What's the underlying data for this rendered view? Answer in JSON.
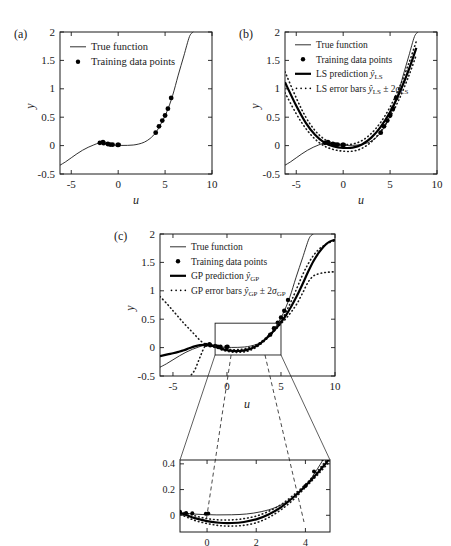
{
  "figure": {
    "panels": [
      {
        "tag": "(a)",
        "xlabel": "u",
        "ylabel": "y",
        "xticks": [
          "-5",
          "0",
          "5",
          "10"
        ],
        "yticks": [
          "-0.5",
          "0",
          "0.5",
          "1",
          "1.5",
          "2"
        ],
        "legend": [
          {
            "marker": "line-thin",
            "label": "True function"
          },
          {
            "marker": "dot",
            "label": "Training data points"
          }
        ]
      },
      {
        "tag": "(b)",
        "xlabel": "u",
        "ylabel": "y",
        "xticks": [
          "-5",
          "0",
          "5",
          "10"
        ],
        "yticks": [
          "-0.5",
          "0",
          "0.5",
          "1",
          "1.5",
          "2"
        ],
        "legend": [
          {
            "marker": "line-thin",
            "label": "True function"
          },
          {
            "marker": "dot",
            "label": "Training data points"
          },
          {
            "marker": "line-thick",
            "label": "LS prediction",
            "math_base": "y",
            "math_hat": true,
            "math_sub": "LS"
          },
          {
            "marker": "dotted",
            "label": "LS error bars",
            "math_base": "y",
            "math_hat": true,
            "math_sub": "LS",
            "math_tail": "± 2",
            "math_tail_sym": "σ",
            "math_tail_sub": "LS"
          }
        ]
      },
      {
        "tag": "(c)",
        "xlabel": "u",
        "ylabel": "y",
        "xticks": [
          "-5",
          "0",
          "5",
          "10"
        ],
        "yticks": [
          "-0.5",
          "0",
          "0.5",
          "1",
          "1.5",
          "2"
        ],
        "legend": [
          {
            "marker": "line-thin",
            "label": "True function"
          },
          {
            "marker": "dot",
            "label": "Training data points"
          },
          {
            "marker": "line-thick",
            "label": "GP prediction",
            "math_base": "y",
            "math_hat": true,
            "math_sub": "GP"
          },
          {
            "marker": "dotted",
            "label": "GP error bars",
            "math_base": "y",
            "math_hat": true,
            "math_sub": "GP",
            "math_tail": "± 2",
            "math_tail_sym": "σ",
            "math_tail_sub": "GP"
          }
        ]
      }
    ],
    "inset": {
      "xticks": [
        "0",
        "2",
        "4"
      ],
      "yticks": [
        "0",
        "0.2",
        "0.4"
      ],
      "xlim": [
        -1.1,
        5.0
      ],
      "ylim": [
        -0.13,
        0.43
      ]
    },
    "zoom_box": {
      "x0": -1.1,
      "x1": 5.0,
      "y0": -0.13,
      "y1": 0.43
    }
  },
  "chart_data": {
    "type": "line",
    "title": "",
    "xlabel": "u",
    "ylabel": "y",
    "xlim": [
      -6.2,
      10
    ],
    "ylim": [
      -0.5,
      2
    ],
    "xticks": [
      -5,
      0,
      5,
      10
    ],
    "yticks": [
      -0.5,
      0,
      0.5,
      1,
      1.5,
      2
    ],
    "grid": false,
    "legend_position": "top-left",
    "training_points": {
      "x": [
        -1.95,
        -1.62,
        -1.55,
        -1.1,
        -0.85,
        -0.6,
        -0.05,
        0.05,
        4.0,
        4.35,
        4.7,
        5.0,
        5.3,
        5.65
      ],
      "y": [
        0.048,
        0.062,
        0.042,
        0.028,
        0.018,
        0.016,
        0.012,
        0.014,
        0.228,
        0.34,
        0.44,
        0.53,
        0.65,
        0.84
      ]
    },
    "series": [
      {
        "name": "True function",
        "style": "thin-solid",
        "comment": "smooth sigmoid-like cubic through data; y=0 plateau near u in [-0.5,2], rises steeply beyond u=4",
        "x": [
          -6.2,
          -5.6,
          -5.0,
          -4.4,
          -3.8,
          -3.2,
          -2.6,
          -2.0,
          -1.4,
          -0.8,
          -0.2,
          0.4,
          1.0,
          1.6,
          2.2,
          2.8,
          3.4,
          4.0,
          4.6,
          5.2,
          5.8,
          6.4,
          7.0,
          7.6,
          8.0
        ],
        "y": [
          -0.345,
          -0.285,
          -0.215,
          -0.145,
          -0.082,
          -0.03,
          0.012,
          0.045,
          0.03,
          0.014,
          0.006,
          0.003,
          0.004,
          0.01,
          0.028,
          0.062,
          0.125,
          0.228,
          0.395,
          0.6,
          0.88,
          1.24,
          1.58,
          1.92,
          2.0
        ]
      },
      {
        "name": "LS prediction",
        "style": "thick-solid",
        "panel": "b",
        "comment": "quadratic least-squares fit, minimum near u=1",
        "x": [
          -6.2,
          -5.0,
          -4.0,
          -3.0,
          -2.0,
          -1.0,
          0.0,
          1.0,
          2.0,
          3.0,
          4.0,
          5.0,
          6.0,
          7.0,
          7.8
        ],
        "y": [
          1.115,
          0.7,
          0.405,
          0.19,
          0.052,
          -0.015,
          -0.04,
          -0.035,
          0.02,
          0.14,
          0.33,
          0.59,
          0.93,
          1.34,
          1.72
        ]
      },
      {
        "name": "LS error bars upper",
        "style": "dotted",
        "panel": "b",
        "x": [
          -6.2,
          -5.0,
          -4.0,
          -3.0,
          -2.0,
          -1.0,
          0.0,
          1.0,
          2.0,
          3.0,
          4.0,
          5.0,
          6.0,
          7.0,
          7.8
        ],
        "y": [
          1.3,
          0.84,
          0.505,
          0.265,
          0.112,
          0.04,
          0.018,
          0.028,
          0.088,
          0.215,
          0.41,
          0.68,
          1.03,
          1.45,
          1.84
        ]
      },
      {
        "name": "LS error bars lower",
        "style": "dotted",
        "panel": "b",
        "x": [
          -6.2,
          -5.0,
          -4.0,
          -3.0,
          -2.0,
          -1.0,
          0.0,
          1.0,
          2.0,
          3.0,
          4.0,
          5.0,
          6.0,
          7.0,
          7.8
        ],
        "y": [
          0.93,
          0.56,
          0.305,
          0.115,
          -0.008,
          -0.07,
          -0.098,
          -0.098,
          -0.048,
          0.065,
          0.25,
          0.5,
          0.83,
          1.23,
          1.6
        ]
      },
      {
        "name": "GP prediction",
        "style": "thick-solid",
        "panel": "c",
        "comment": "GP mean; tracks data closely, flattens outside training range",
        "x": [
          -6.2,
          -5.5,
          -5.0,
          -4.5,
          -4.0,
          -3.5,
          -3.0,
          -2.5,
          -2.0,
          -1.5,
          -1.0,
          -0.5,
          0.0,
          0.5,
          1.0,
          1.5,
          2.0,
          2.5,
          3.0,
          3.5,
          4.0,
          4.5,
          5.0,
          5.5,
          6.0,
          6.5,
          7.0,
          7.5,
          8.0,
          8.5,
          9.0,
          9.5,
          10.0
        ],
        "y": [
          -0.15,
          -0.12,
          -0.1,
          -0.076,
          -0.048,
          -0.012,
          0.022,
          0.044,
          0.048,
          0.04,
          0.012,
          -0.022,
          -0.045,
          -0.058,
          -0.06,
          -0.052,
          -0.032,
          0.006,
          0.062,
          0.138,
          0.228,
          0.33,
          0.445,
          0.58,
          0.74,
          0.92,
          1.12,
          1.33,
          1.52,
          1.67,
          1.79,
          1.865,
          1.9
        ]
      },
      {
        "name": "GP error bars upper",
        "style": "dotted",
        "panel": "c",
        "x": [
          -6.2,
          -5.5,
          -5.0,
          -4.5,
          -4.0,
          -3.5,
          -3.0,
          -2.5,
          -2.0,
          -1.5,
          -1.0,
          -0.5,
          0.0,
          0.5,
          1.0,
          1.5,
          2.0,
          2.5,
          3.0,
          3.5,
          4.0,
          4.5,
          5.0,
          5.5,
          6.0,
          6.5,
          7.0,
          7.5,
          8.0,
          8.5,
          9.0,
          9.5,
          10.0
        ],
        "y": [
          0.9,
          0.76,
          0.65,
          0.54,
          0.43,
          0.33,
          0.23,
          0.13,
          0.062,
          0.048,
          0.024,
          -0.004,
          -0.026,
          -0.036,
          -0.036,
          -0.026,
          -0.006,
          0.03,
          0.082,
          0.155,
          0.24,
          0.345,
          0.47,
          0.64,
          0.84,
          1.06,
          1.28,
          1.47,
          1.62,
          1.73,
          1.8,
          1.85,
          1.88
        ]
      },
      {
        "name": "GP error bars lower",
        "style": "dotted",
        "panel": "c",
        "x": [
          -6.2,
          -5.5,
          -5.0,
          -4.5,
          -4.0,
          -3.5,
          -3.0,
          -2.5,
          -2.0,
          -1.5,
          -1.0,
          -0.5,
          0.0,
          0.5,
          1.0,
          1.5,
          2.0,
          2.5,
          3.0,
          3.5,
          4.0,
          4.5,
          5.0,
          5.5,
          6.0,
          6.5,
          7.0,
          7.5,
          8.0,
          8.5,
          9.0,
          9.5,
          10.0
        ],
        "y": [
          -1.15,
          -1.0,
          -0.88,
          -0.76,
          -0.64,
          -0.52,
          -0.4,
          -0.17,
          0.034,
          0.032,
          0.0,
          -0.04,
          -0.064,
          -0.08,
          -0.084,
          -0.078,
          -0.058,
          -0.018,
          0.042,
          0.12,
          0.216,
          0.315,
          0.42,
          0.52,
          0.64,
          0.78,
          0.96,
          1.15,
          1.26,
          1.3,
          1.32,
          1.33,
          1.335
        ]
      }
    ]
  }
}
